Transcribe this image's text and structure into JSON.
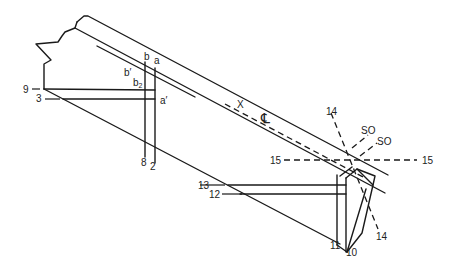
{
  "diagram": {
    "type": "technical-line-drawing",
    "colors": {
      "line": "#1a1a1a",
      "background": "#ffffff",
      "text": "#222222"
    },
    "labels": {
      "a": "a",
      "b": "b",
      "b_prime": "b′",
      "b2": "b",
      "b2_sub": "2",
      "a_prime": "a′",
      "n9": "9",
      "n3": "3",
      "n8": "8",
      "n2": "2",
      "x": "X",
      "centerline": "℄",
      "n14_top": "14",
      "so1": "SO",
      "so2": "SO",
      "n15_left": "15",
      "n15_right": "15",
      "n13": "13",
      "n12": "12",
      "n11": "11",
      "n10": "10",
      "n14_bottom": "14"
    }
  }
}
